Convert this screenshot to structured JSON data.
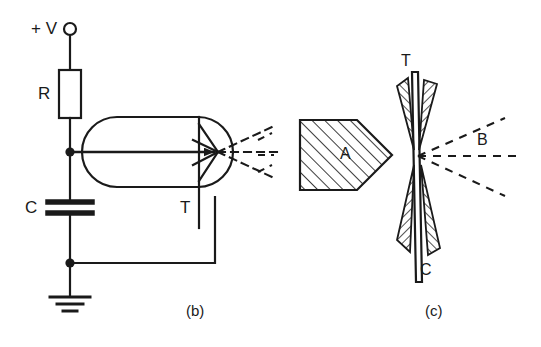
{
  "figure": {
    "type": "technical-diagram",
    "background_color": "#ffffff",
    "ink_color": "#1a1a1a"
  },
  "panel_b": {
    "caption": "(b)",
    "supply_label": "+ V",
    "resistor_label": "R",
    "capacitor_label": "C",
    "target_label": "T",
    "components": [
      {
        "name": "supply-terminal",
        "kind": "open-circle-terminal",
        "label": "+ V"
      },
      {
        "name": "resistor",
        "kind": "rectangle-resistor",
        "label": "R"
      },
      {
        "name": "capacitor",
        "kind": "parallel-plate-capacitor",
        "label": "C"
      },
      {
        "name": "ground",
        "kind": "earth-ground-3-bar",
        "label": ""
      },
      {
        "name": "tube",
        "kind": "capsule-envelope",
        "label": ""
      },
      {
        "name": "electron-beam-arrow",
        "kind": "arrow-right",
        "label": ""
      },
      {
        "name": "target-electrode",
        "kind": "vertical-electrode",
        "label": "T"
      }
    ],
    "node_dots": 2,
    "emitted_rays_dashed": 3,
    "emitted_rays_solid": 4
  },
  "panel_c": {
    "caption": "(c)",
    "anode_label": "A",
    "foil_label": "T",
    "cathode_label": "C",
    "beam_label": "B",
    "components": [
      {
        "name": "anode-block",
        "kind": "hatched-pentagon",
        "label": "A"
      },
      {
        "name": "transmission-foil",
        "kind": "thin-vertical-strip",
        "label": "T"
      },
      {
        "name": "cathode-wedges",
        "kind": "hatched-wedge-pair",
        "label": "C"
      },
      {
        "name": "output-beam",
        "kind": "dashed-ray-fan",
        "label": "B"
      }
    ],
    "hatch_angle_deg": 45,
    "beam_rays_dashed": 3
  }
}
